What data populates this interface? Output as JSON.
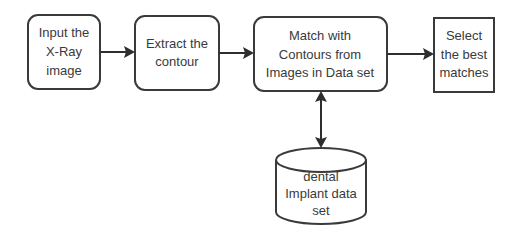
{
  "diagram": {
    "type": "flowchart",
    "nodes": [
      {
        "id": "input",
        "shape": "rounded-rect",
        "lines": [
          "Input the",
          "X-Ray",
          "image"
        ]
      },
      {
        "id": "extract",
        "shape": "rounded-rect",
        "lines": [
          "Extract the",
          "contour"
        ]
      },
      {
        "id": "match",
        "shape": "rounded-rect",
        "lines": [
          "Match with",
          "Contours from",
          "Images in Data set"
        ]
      },
      {
        "id": "select",
        "shape": "rect",
        "lines": [
          "Select",
          "the best",
          "matches"
        ]
      },
      {
        "id": "dataset",
        "shape": "cylinder",
        "lines": [
          "dental",
          "Implant data",
          "set"
        ]
      }
    ],
    "edges": [
      {
        "from": "input",
        "to": "extract",
        "direction": "forward"
      },
      {
        "from": "extract",
        "to": "match",
        "direction": "forward"
      },
      {
        "from": "match",
        "to": "select",
        "direction": "forward"
      },
      {
        "from": "match",
        "to": "dataset",
        "direction": "bidirectional"
      }
    ]
  }
}
